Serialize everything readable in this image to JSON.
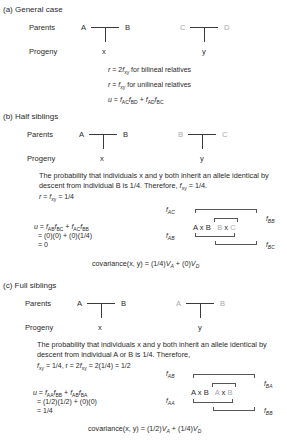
{
  "sections": [
    {
      "label": "(a) General case",
      "parents_label": "Parents",
      "progeny_label": "Progeny",
      "cross1": {
        "left": "A",
        "right": "B",
        "child": "x"
      },
      "cross2": {
        "left": "C",
        "right": "D",
        "child": "y"
      },
      "equations": [
        {
          "lhs": "r",
          "rel": " = 2",
          "f": "f",
          "sub": "xy",
          "tail": " for bilineal relatives"
        },
        {
          "lhs": "r",
          "rel": " = ",
          "f": "f",
          "sub": "xy",
          "tail": " for unilineal relatives"
        }
      ],
      "u_eq": {
        "lhs": "u",
        "t1a": "AC",
        "t1b": "BD",
        "t2a": "AD",
        "t2b": "BC"
      }
    },
    {
      "label": "(b) Half siblings",
      "parents_label": "Parents",
      "progeny_label": "Progeny",
      "cross1": {
        "left": "A",
        "right": "B",
        "child": "x"
      },
      "cross2": {
        "left": "B",
        "right": "C",
        "child": "y"
      },
      "paragraph": "The probability that individuals x and y both inherit an allele identical by descent from individual B is 1/4. Therefore, ",
      "paragraph_tail": " = 1/4.",
      "r_line": " = 1/4",
      "u_eq": {
        "lhs": "u",
        "t1a": "AB",
        "t1b": "BC",
        "t2a": "AC",
        "t2b": "BB"
      },
      "u_steps": [
        "= (0)(0) + (0)(1/4)",
        "= 0"
      ],
      "bracket_labels": {
        "top_outer": "AC",
        "top_inner": "BB",
        "bot_left": "AB",
        "bot_right": "BC"
      },
      "cross_text": {
        "a": "A",
        "x1": "x",
        "b": "B",
        "b2": "B",
        "x2": "x",
        "c": "C"
      },
      "covariance": {
        "prefix": "covariance(x, y) = (1/4)",
        "va": "V",
        "va_sub": "A",
        "mid": " + (0)",
        "vd": "V",
        "vd_sub": "D"
      }
    },
    {
      "label": "(c) Full siblings",
      "parents_label": "Parents",
      "progeny_label": "Progeny",
      "cross1": {
        "left": "A",
        "right": "B",
        "child": "x"
      },
      "cross2": {
        "left": "A",
        "right": "B",
        "child": "y"
      },
      "paragraph": "The probability that individuals x and y both inherit an allele identical by descent from individual A or B is 1/4. Therefore,",
      "r_line": " = 1/4, r = 2",
      "r_line_tail": " = 2(1/4) = 1/2",
      "u_eq": {
        "lhs": "u",
        "t1a": "AA",
        "t1b": "BB",
        "t2a": "AB",
        "t2b": "BA"
      },
      "u_steps": [
        "= (1/2)(1/2) + (0)(0)",
        "= 1/4"
      ],
      "bracket_labels": {
        "top_outer": "AB",
        "top_inner": "BA",
        "bot_left": "AA",
        "bot_right": "BB"
      },
      "cross_text": {
        "a": "A",
        "x1": "x",
        "b": "B",
        "b2": "A",
        "x2": "x",
        "c": "B"
      },
      "covariance": {
        "prefix": "covariance(x, y) = (1/2)",
        "va": "V",
        "va_sub": "A",
        "mid": " + (1/4)",
        "vd": "V",
        "vd_sub": "D"
      }
    }
  ],
  "colors": {
    "text": "#2a2a2a",
    "faded": "#a8a8a8",
    "line": "#3a3a3a"
  }
}
